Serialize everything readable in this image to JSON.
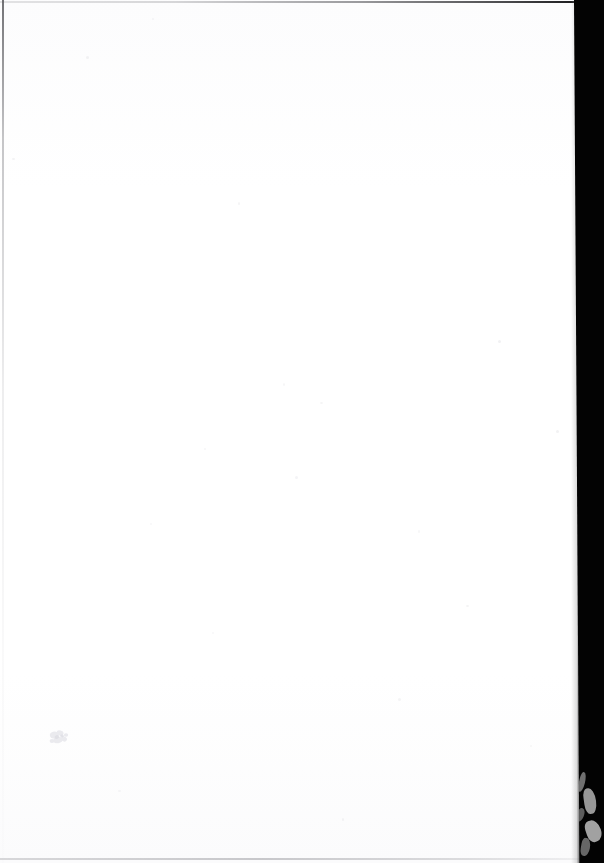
{
  "document": {
    "kind": "scanned-page",
    "page_state": "blank",
    "visible_text": "",
    "width_px": 604,
    "height_px": 863
  },
  "paper": {
    "name": "blank-page-surface",
    "color": "#ffffff",
    "tone_top": "#fcfcfd",
    "tone_bottom": "#fbfbfc",
    "width_px": 582,
    "height_px": 863
  },
  "backdrop": {
    "name": "scanner-backdrop",
    "color": "#030303",
    "position": "right",
    "width_px": 30,
    "edge_x_top_px": 580,
    "edge_x_bottom_px": 585
  },
  "borders": {
    "top": {
      "name": "page-edge-top",
      "y_px": 1,
      "color_left": "#cdcdcf",
      "color_right": "#141416"
    },
    "left": {
      "name": "page-edge-left",
      "x_px": 2,
      "color_top": "#5a5a5e",
      "color_bottom": "#f0f0f2"
    },
    "bottom": {
      "name": "page-edge-bottom",
      "y_px": 858,
      "color": "#b2b2b6"
    }
  },
  "marks": [
    {
      "name": "ink-smudge",
      "description": "faint light-gray smudge",
      "x_px": 48,
      "y_px": 728,
      "width_px": 24,
      "height_px": 20,
      "color": "#ececf0"
    }
  ],
  "edge_streaks": {
    "name": "page-edge-highlight-streaks",
    "color": "#c9c9c9",
    "region": "bottom-right",
    "count": 5
  }
}
